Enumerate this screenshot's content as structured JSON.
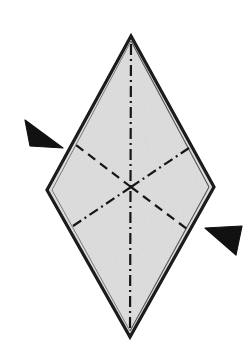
{
  "figure": {
    "description": "Shaded diamond (rhombus) shape with dashed and dash-dot fold lines radiating from the center, and two solid black arrowheads indicating fold directions at the left and right sides.",
    "canvas": {
      "width": 252,
      "height": 360
    },
    "background_color": "#ffffff"
  },
  "colors": {
    "background": "#ffffff",
    "paper_fill": "#d6d6d6",
    "paper_fill_light": "#e0e0e0",
    "outline": "#1a1a1a",
    "fold_line": "#161616",
    "arrow_fill": "#111111"
  },
  "shape": {
    "name": "rhombus",
    "vertices": {
      "top": {
        "x": 131,
        "y": 36
      },
      "right": {
        "x": 214,
        "y": 187
      },
      "bottom": {
        "x": 130,
        "y": 337
      },
      "left": {
        "x": 47,
        "y": 190
      }
    },
    "center": {
      "x": 131,
      "y": 187
    },
    "outline_width": 3.2,
    "inner_edge_offset": 3.0
  },
  "fold_lines": [
    {
      "name": "vertical-center-crease",
      "style": "dash-dot",
      "from": {
        "x": 131,
        "y": 44
      },
      "to": {
        "x": 130,
        "y": 330
      },
      "width": 2.2,
      "dasharray": "11,4,2,4"
    },
    {
      "name": "upper-left-crease",
      "style": "dashed",
      "from": {
        "x": 131,
        "y": 187
      },
      "to": {
        "x": 76,
        "y": 145
      },
      "width": 2.2,
      "dasharray": "9,6"
    },
    {
      "name": "upper-right-crease",
      "style": "dash-dot",
      "from": {
        "x": 131,
        "y": 187
      },
      "to": {
        "x": 189,
        "y": 148
      },
      "width": 2.2,
      "dasharray": "10,4,2,4"
    },
    {
      "name": "lower-left-crease",
      "style": "dash-dot",
      "from": {
        "x": 131,
        "y": 187
      },
      "to": {
        "x": 73,
        "y": 226
      },
      "width": 2.2,
      "dasharray": "10,4,2,4"
    },
    {
      "name": "lower-right-crease",
      "style": "dashed",
      "from": {
        "x": 131,
        "y": 187
      },
      "to": {
        "x": 187,
        "y": 229
      },
      "width": 2.2,
      "dasharray": "9,6"
    }
  ],
  "arrows": [
    {
      "name": "left-fold-arrow",
      "direction": "points-right-down",
      "points": "25,120 63,148 30,146",
      "fill": "#111111"
    },
    {
      "name": "right-fold-arrow",
      "direction": "points-left-down",
      "points": "242,226 205,228 236,255",
      "fill": "#111111"
    }
  ]
}
